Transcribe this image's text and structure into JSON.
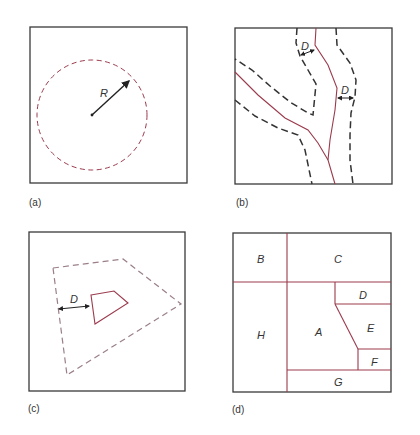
{
  "panels": {
    "a": {
      "caption": "(a)",
      "radius_label": "R"
    },
    "b": {
      "caption": "(b)",
      "distance_label_1": "D",
      "distance_label_2": "D"
    },
    "c": {
      "caption": "(c)",
      "distance_label": "D"
    },
    "d": {
      "caption": "(d)",
      "regions": [
        "A",
        "B",
        "C",
        "D",
        "E",
        "F",
        "G",
        "H"
      ]
    }
  },
  "colors": {
    "feature": "#9b3a4c",
    "frame": "#3a3a3a",
    "buffer_dash": "#333333"
  }
}
